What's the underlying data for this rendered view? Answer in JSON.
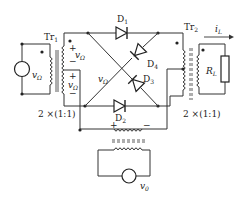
{
  "diagram": {
    "type": "ring-modulator-circuit",
    "transformers": [
      {
        "id": "tr1",
        "label": "Tr",
        "sub": "1",
        "ratio_label": "2 ×(1:1)"
      },
      {
        "id": "tr2",
        "label": "Tr",
        "sub": "2",
        "ratio_label": "2 ×(1:1)"
      },
      {
        "id": "tr3",
        "label": ""
      }
    ],
    "diodes": [
      {
        "id": "d1",
        "label": "D",
        "sub": "1"
      },
      {
        "id": "d2",
        "label": "D",
        "sub": "2"
      },
      {
        "id": "d3",
        "label": "D",
        "sub": "3"
      },
      {
        "id": "d4",
        "label": "D",
        "sub": "4"
      }
    ],
    "sources": [
      {
        "id": "src-omega",
        "label": "v",
        "sub": "Ω"
      },
      {
        "id": "src-zero",
        "label": "v",
        "sub": "0"
      }
    ],
    "voltage_labels": {
      "primary": {
        "label": "v",
        "sub": "Ω"
      },
      "secondary_upper": {
        "label": "v",
        "sub": "Ω"
      },
      "secondary_lower": {
        "label": "v",
        "sub": "Ω"
      },
      "cross": {
        "label": "v",
        "sub": "Ω"
      },
      "plus": "+",
      "minus": "−"
    },
    "load": {
      "label": "R",
      "sub": "L"
    },
    "current": {
      "label": "i",
      "sub": "L"
    }
  }
}
